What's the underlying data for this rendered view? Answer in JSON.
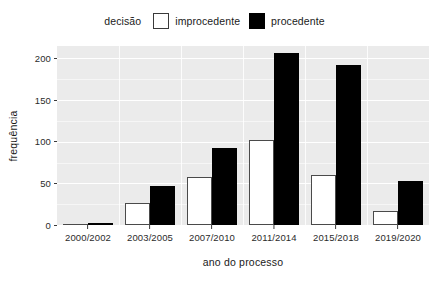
{
  "chart_data": {
    "type": "bar",
    "title": "",
    "subtitle": "",
    "xlabel": "ano do processo",
    "ylabel": "frequência",
    "categories": [
      "2000/2002",
      "2003/2005",
      "2007/2010",
      "2011/2014",
      "2015/2018",
      "2019/2020"
    ],
    "series": [
      {
        "name": "improcedente",
        "color": "#ffffff",
        "values": [
          1,
          27,
          58,
          102,
          60,
          17
        ]
      },
      {
        "name": "procedente",
        "color": "#000000",
        "values": [
          3,
          47,
          92,
          206,
          192,
          53
        ]
      }
    ],
    "ylim": [
      0,
      215
    ],
    "yticks": [
      0,
      50,
      100,
      150,
      200
    ],
    "ytick_labels": [
      "0",
      "50",
      "100",
      "150",
      "200"
    ],
    "grid": true,
    "grid_color": "#ffffff",
    "panel_background": "#ebebeb",
    "legend_position": "top",
    "legend_title": "decisão",
    "bar_mode": "grouped"
  },
  "legend": {
    "title": "decisão",
    "items": [
      {
        "label": "improcedente",
        "swatch": "open-square-icon"
      },
      {
        "label": "procedente",
        "swatch": "filled-square-icon"
      }
    ]
  },
  "axes": {
    "y_title": "frequência",
    "x_title": "ano do processo",
    "y_ticks": [
      "0",
      "50",
      "100",
      "150",
      "200"
    ],
    "x_ticks": [
      "2000/2002",
      "2003/2005",
      "2007/2010",
      "2011/2014",
      "2015/2018",
      "2019/2020"
    ]
  }
}
